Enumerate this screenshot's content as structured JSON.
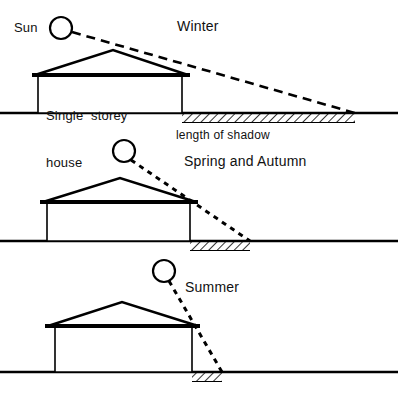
{
  "diagram": {
    "title_visible": false,
    "background_color": "#ffffff",
    "ink_color": "#000000",
    "labels": {
      "sun": "Sun",
      "winter": "Winter",
      "house_line1": "Single  storey",
      "house_line2": "house",
      "length_of_shadow": "length of shadow",
      "spring_autumn": "Spring and Autumn",
      "summer": "Summer"
    },
    "scenes": [
      {
        "name": "winter",
        "season_label": "Winter",
        "sun_altitude": "low",
        "shadow_length": "long",
        "ground_y": 113,
        "house": {
          "left": 38,
          "right": 182,
          "wall_top": 76,
          "ridge_x": 113,
          "ridge_y": 50,
          "eave_left": 32,
          "eave_right": 190
        },
        "sun": {
          "cx": 61,
          "cy": 28,
          "r": 11
        },
        "ray": {
          "x1": 72,
          "y1": 32,
          "x2": 355,
          "y2": 113
        },
        "shadow": {
          "x1": 182,
          "x2": 355
        }
      },
      {
        "name": "spring_autumn",
        "season_label": "Spring and Autumn",
        "sun_altitude": "medium",
        "shadow_length": "medium",
        "ground_y": 241,
        "house": {
          "left": 47,
          "right": 190,
          "wall_top": 203,
          "ridge_x": 120,
          "ridge_y": 178,
          "eave_left": 40,
          "eave_right": 198
        },
        "sun": {
          "cx": 124,
          "cy": 151,
          "r": 11
        },
        "ray": {
          "x1": 132,
          "y1": 161,
          "x2": 250,
          "y2": 241
        },
        "shadow": {
          "x1": 190,
          "x2": 250
        }
      },
      {
        "name": "summer",
        "season_label": "Summer",
        "sun_altitude": "high",
        "shadow_length": "short",
        "ground_y": 372,
        "house": {
          "left": 55,
          "right": 192,
          "wall_top": 327,
          "ridge_x": 122,
          "ridge_y": 302,
          "eave_left": 45,
          "eave_right": 200
        },
        "sun": {
          "cx": 164,
          "cy": 271,
          "r": 11
        },
        "ray": {
          "x1": 170,
          "y1": 282,
          "x2": 222,
          "y2": 372
        },
        "shadow": {
          "x1": 192,
          "x2": 222
        }
      }
    ]
  }
}
